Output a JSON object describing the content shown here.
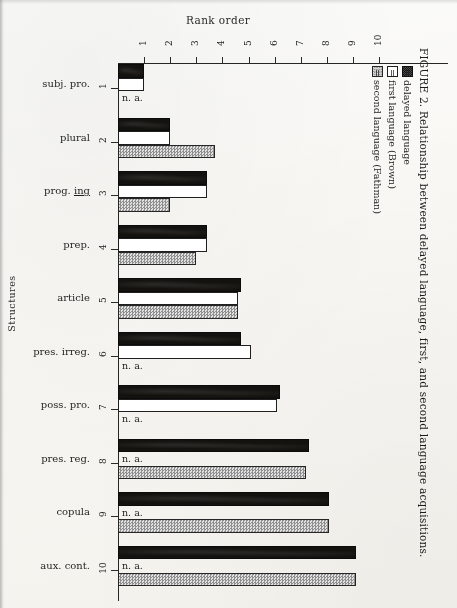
{
  "figure": {
    "caption": "FIGURE 2.   Relationship between delayed language, first, and second language acquisitions.",
    "x_axis_title": "Rank order",
    "y_axis_title": "Structures",
    "na_label": "n. a."
  },
  "legend": {
    "items": [
      {
        "swatch": "delayed-swatch",
        "text": "= delayed language"
      },
      {
        "swatch": "first-swatch",
        "text": "= first language (Brown)"
      },
      {
        "swatch": "second-swatch",
        "text": "= second language (Fathman)"
      }
    ]
  },
  "chart_data": {
    "type": "bar",
    "orientation": "horizontal",
    "title": "FIGURE 2. Relationship between delayed language, first, and second language acquisitions.",
    "xlabel": "Rank order",
    "ylabel": "Structures",
    "xlim": [
      0,
      10.5
    ],
    "xticks": [
      "1",
      "2",
      "3",
      "4",
      "5",
      "6",
      "7",
      "8",
      "9",
      "10"
    ],
    "grid": false,
    "legend_position": "right",
    "categories": [
      "subj. pro.",
      "plural",
      "prog. ing",
      "prep.",
      "article",
      "pres. irreg.",
      "poss. pro.",
      "pres. reg.",
      "copula",
      "aux. cont."
    ],
    "category_ranks": [
      "1",
      "2",
      "3",
      "4",
      "5",
      "6",
      "7",
      "8",
      "9",
      "10"
    ],
    "series": [
      {
        "name": "delayed language",
        "key": "delayed",
        "fill": "black",
        "values": [
          1.0,
          2.0,
          3.4,
          3.4,
          4.7,
          4.7,
          6.2,
          7.3,
          8.1,
          9.1
        ]
      },
      {
        "name": "first language (Brown)",
        "key": "first",
        "fill": "white",
        "values": [
          1.0,
          2.0,
          3.4,
          3.4,
          4.6,
          5.1,
          6.1,
          null,
          null,
          null
        ]
      },
      {
        "name": "second language (Fathman)",
        "key": "second",
        "fill": "gray-checker",
        "values": [
          null,
          3.7,
          2.0,
          3.0,
          4.6,
          null,
          null,
          7.2,
          8.1,
          9.1
        ]
      }
    ],
    "not_available_marker": "n. a."
  },
  "colors": {
    "paper": "#fbfbfa",
    "ink": "#1a1a1a",
    "delayed_fill": "#14120f",
    "first_fill": "#ffffff",
    "second_fill": "#c9c9c9"
  }
}
